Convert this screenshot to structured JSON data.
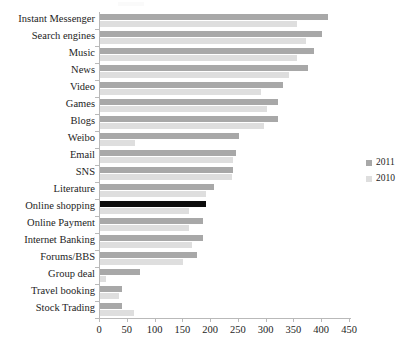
{
  "chart_data": {
    "type": "bar",
    "orientation": "horizontal",
    "title": "",
    "subtitle": "",
    "xlabel": "",
    "ylabel": "",
    "xlim": [
      0,
      450
    ],
    "xticks": [
      0,
      50,
      100,
      150,
      200,
      250,
      300,
      350,
      400,
      450
    ],
    "grid": false,
    "legend_position": "right",
    "categories": [
      "Instant Messenger",
      "Search engines",
      "Music",
      "News",
      "Video",
      "Games",
      "Blogs",
      "Weibo",
      "Email",
      "SNS",
      "Literature",
      "Online shopping",
      "Online Payment",
      "Internet Banking",
      "Forums/BBS",
      "Group deal",
      "Travel booking",
      "Stock Trading"
    ],
    "series": [
      {
        "name": "2011",
        "color": "#a8a8a8",
        "values": [
          410,
          400,
          385,
          375,
          330,
          320,
          320,
          250,
          245,
          240,
          205,
          190,
          185,
          185,
          175,
          72,
          40,
          40
        ],
        "highlight_index": 11,
        "highlight_color": "#0d0d0d"
      },
      {
        "name": "2010",
        "color": "#dedede",
        "values": [
          355,
          370,
          355,
          340,
          290,
          300,
          295,
          63,
          240,
          238,
          190,
          160,
          160,
          165,
          150,
          10,
          35,
          62
        ]
      }
    ]
  },
  "legend": {
    "items": [
      {
        "label": "2011",
        "color": "#a8a8a8"
      },
      {
        "label": "2010",
        "color": "#dedede"
      }
    ]
  },
  "axis": {
    "x_tick_labels": [
      "0",
      "50",
      "100",
      "150",
      "200",
      "250",
      "300",
      "350",
      "400",
      "450"
    ]
  }
}
